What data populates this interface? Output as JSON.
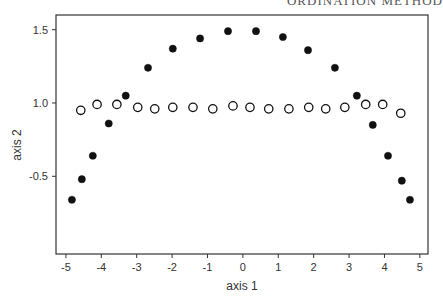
{
  "header": {
    "text": "ORDINATION METHOD"
  },
  "chart_data": {
    "type": "scatter",
    "title": "",
    "xlabel": "axis 1",
    "ylabel": "axis 2",
    "xlim": [
      -5.28,
      5.23
    ],
    "ylim": [
      -0.03,
      1.6
    ],
    "grid": false,
    "legend": null,
    "x_ticks": [
      -5,
      -4,
      -3,
      -2,
      -1,
      0,
      1,
      2,
      3,
      4,
      5
    ],
    "x_tick_labels": [
      "-5",
      "-4",
      "-3",
      "-2",
      "-1",
      "0",
      "1",
      "2",
      "3",
      "4",
      "5"
    ],
    "y_ticks": [
      0.5,
      1.0,
      1.5
    ],
    "y_tick_labels": [
      "-0.5",
      "1.0",
      "1.5"
    ],
    "series": [
      {
        "name": "filled",
        "marker": "filled-circle",
        "color": "#111111",
        "points": [
          [
            -4.83,
            0.34
          ],
          [
            -4.55,
            0.48
          ],
          [
            -4.24,
            0.64
          ],
          [
            -3.79,
            0.86
          ],
          [
            -3.31,
            1.05
          ],
          [
            -2.68,
            1.24
          ],
          [
            -1.98,
            1.37
          ],
          [
            -1.21,
            1.44
          ],
          [
            -0.42,
            1.49
          ],
          [
            0.37,
            1.49
          ],
          [
            1.13,
            1.45
          ],
          [
            1.84,
            1.36
          ],
          [
            2.6,
            1.24
          ],
          [
            3.22,
            1.05
          ],
          [
            3.67,
            0.85
          ],
          [
            4.1,
            0.64
          ],
          [
            4.49,
            0.47
          ],
          [
            4.72,
            0.34
          ]
        ]
      },
      {
        "name": "open",
        "marker": "open-circle",
        "color": "#111111",
        "points": [
          [
            -4.58,
            0.95
          ],
          [
            -4.12,
            0.99
          ],
          [
            -3.56,
            0.99
          ],
          [
            -2.97,
            0.97
          ],
          [
            -2.49,
            0.96
          ],
          [
            -1.98,
            0.97
          ],
          [
            -1.41,
            0.97
          ],
          [
            -0.85,
            0.96
          ],
          [
            -0.28,
            0.98
          ],
          [
            0.2,
            0.97
          ],
          [
            0.73,
            0.96
          ],
          [
            1.3,
            0.96
          ],
          [
            1.86,
            0.97
          ],
          [
            2.34,
            0.96
          ],
          [
            2.88,
            0.97
          ],
          [
            3.47,
            0.99
          ],
          [
            3.95,
            0.99
          ],
          [
            4.46,
            0.93
          ]
        ]
      }
    ]
  }
}
